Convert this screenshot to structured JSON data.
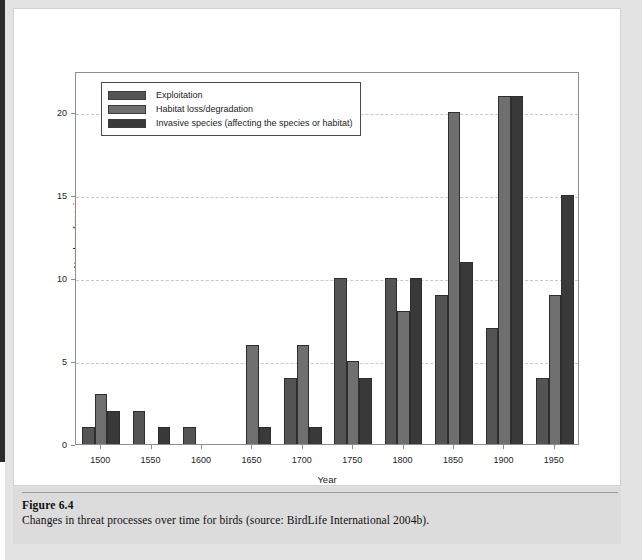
{
  "caption": {
    "label": "Figure 6.4",
    "text": "Changes in threat processes over time for birds (source: BirdLife International 2004b)."
  },
  "legend": {
    "items": [
      {
        "label": "Exploitation",
        "color": "#545454"
      },
      {
        "label": "Habitat loss/degradation",
        "color": "#6f6f6f"
      },
      {
        "label": "Invasive species (affecting the species or habitat)",
        "color": "#393939"
      }
    ]
  },
  "chart_data": {
    "type": "bar",
    "title": "",
    "xlabel": "Year",
    "ylabel": "Number of species",
    "categories": [
      "1500",
      "1550",
      "1600",
      "1650",
      "1700",
      "1750",
      "1800",
      "1850",
      "1900",
      "1950"
    ],
    "series": [
      {
        "name": "Exploitation",
        "color": "#545454",
        "values": [
          1,
          2,
          1,
          0,
          4,
          10,
          10,
          9,
          7,
          4
        ]
      },
      {
        "name": "Habitat loss/degradation",
        "color": "#6f6f6f",
        "values": [
          3,
          0,
          0,
          6,
          6,
          5,
          8,
          20,
          21,
          9
        ]
      },
      {
        "name": "Invasive species (affecting the species or habitat)",
        "color": "#393939",
        "values": [
          2,
          1,
          0,
          1,
          1,
          4,
          10,
          11,
          21,
          15
        ]
      }
    ],
    "ylim": [
      0,
      22.5
    ],
    "yticks": [
      0,
      5,
      10,
      15,
      20
    ],
    "grid": true,
    "legend_position": "top-left"
  }
}
